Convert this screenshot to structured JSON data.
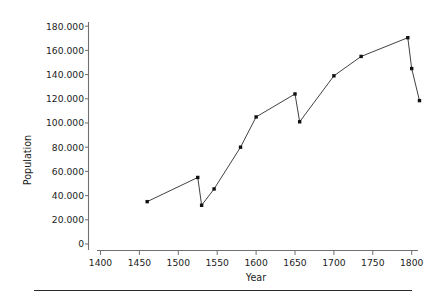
{
  "chart_data": {
    "type": "line",
    "title": "",
    "xlabel": "Year",
    "ylabel": "Population",
    "xlim": [
      1400,
      1815
    ],
    "ylim": [
      0,
      185000
    ],
    "grid": false,
    "legend": null,
    "x_ticks": [
      1400,
      1450,
      1500,
      1550,
      1600,
      1650,
      1700,
      1750,
      1800
    ],
    "x_tick_labels": [
      "1400",
      "1450",
      "1500",
      "1550",
      "1600",
      "1650",
      "1700",
      "1750",
      "1800"
    ],
    "y_ticks": [
      0,
      20000,
      40000,
      60000,
      80000,
      100000,
      120000,
      140000,
      160000,
      180000
    ],
    "y_tick_labels": [
      "0",
      "20.000",
      "40.000",
      "60.000",
      "80.000",
      "100.000",
      "120.000",
      "140.000",
      "160.000",
      "180.000"
    ],
    "series": [
      {
        "name": "Population",
        "marker": "square",
        "color": "#111111",
        "x": [
          1460,
          1525,
          1530,
          1546,
          1580,
          1600,
          1650,
          1656,
          1700,
          1735,
          1795,
          1800,
          1810
        ],
        "values": [
          35000,
          55000,
          32000,
          45500,
          80000,
          105000,
          124000,
          101000,
          139000,
          155000,
          170500,
          145000,
          118500
        ]
      }
    ]
  },
  "footer": {
    "rule_color": "#2a2a2a"
  }
}
